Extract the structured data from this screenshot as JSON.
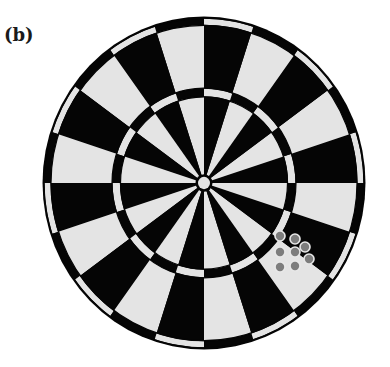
{
  "figure": {
    "panel_label": "(b)"
  },
  "dartboard": {
    "center": [
      204,
      183
    ],
    "scale_y": 1.031,
    "segment_count": 20,
    "first_segment_start_deg": 0,
    "colors": {
      "dark": "#050505",
      "light": "#e4e4e4",
      "background": "#ffffff"
    },
    "radii": {
      "outer_border": 161.5,
      "double_outer": 160,
      "double_inner": 153,
      "single_outer_end": 153,
      "treble_outer": 92,
      "treble_inner": 83.5,
      "bull_ring": 8.5,
      "bull_center": 6
    },
    "first_segment_dark": true
  },
  "dots": {
    "fill": "#7d7d7d",
    "ring": "#e8e8e8",
    "radius": 4.2,
    "ring_width": 1.6,
    "points": [
      [
        280,
        236
      ],
      [
        295,
        239
      ],
      [
        305,
        247
      ],
      [
        280,
        252
      ],
      [
        295,
        252
      ],
      [
        309,
        259
      ],
      [
        280,
        267
      ],
      [
        295,
        266
      ]
    ]
  }
}
